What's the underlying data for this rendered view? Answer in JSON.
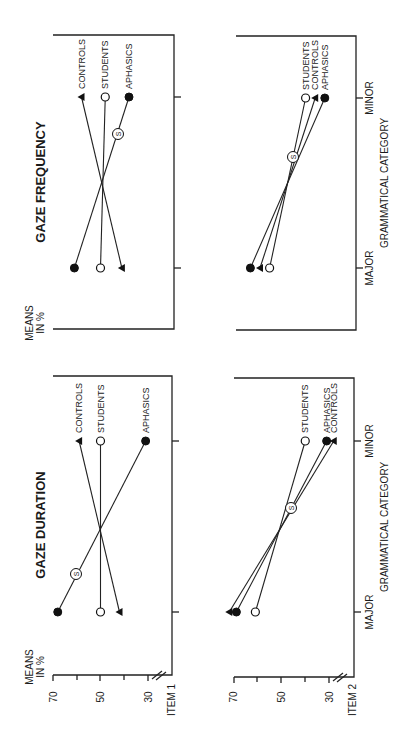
{
  "figure": {
    "orientation": "rotated-90-ccw",
    "y_axis_label": "MEANS IN %",
    "x_axis_label": "GRAMMATICAL CATEGORY",
    "x_categories": [
      "MAJOR",
      "MINOR"
    ],
    "y_ticks": [
      "70",
      "50",
      "30"
    ],
    "item_labels": [
      "ITEM 1",
      "ITEM 2"
    ],
    "panel_titles": [
      "GAZE DURATION",
      "GAZE FREQUENCY"
    ],
    "marker_note": "S"
  },
  "chart_data": [
    {
      "type": "line",
      "title": "GAZE DURATION",
      "subplot": "ITEM 1",
      "xlabel": "GRAMMATICAL CATEGORY",
      "ylabel": "MEANS IN %",
      "categories": [
        "MAJOR",
        "MINOR"
      ],
      "ylim": [
        30,
        70
      ],
      "yticks": [
        70,
        50,
        30
      ],
      "grid": false,
      "legend": "inline labels at MINOR end",
      "series": [
        {
          "name": "CONTROLS",
          "marker": "filled-triangle",
          "values": [
            42,
            59
          ]
        },
        {
          "name": "STUDENTS",
          "marker": "open-circle",
          "values": [
            50,
            50
          ]
        },
        {
          "name": "APHASICS",
          "marker": "filled-circle",
          "values": [
            68,
            31
          ],
          "annotation": "S"
        }
      ]
    },
    {
      "type": "line",
      "title": "GAZE DURATION",
      "subplot": "ITEM 2",
      "xlabel": "GRAMMATICAL CATEGORY",
      "ylabel": "MEANS IN %",
      "categories": [
        "MAJOR",
        "MINOR"
      ],
      "ylim": [
        30,
        70
      ],
      "yticks": [
        70,
        50,
        30
      ],
      "grid": false,
      "legend": "inline labels at MINOR end",
      "series": [
        {
          "name": "STUDENTS",
          "marker": "open-circle",
          "values": [
            61,
            40
          ]
        },
        {
          "name": "APHASICS",
          "marker": "filled-circle",
          "values": [
            69,
            31
          ]
        },
        {
          "name": "CONTROLS",
          "marker": "filled-triangle",
          "values": [
            72,
            28
          ]
        }
      ],
      "annotation": "S"
    },
    {
      "type": "line",
      "title": "GAZE FREQUENCY",
      "subplot": "ITEM 1",
      "xlabel": "",
      "ylabel": "MEANS IN %",
      "categories": [
        "MAJOR",
        "MINOR"
      ],
      "ylim": [
        30,
        70
      ],
      "grid": false,
      "legend": "inline labels at MINOR end",
      "series": [
        {
          "name": "CONTROLS",
          "marker": "filled-triangle",
          "values": [
            41,
            58
          ]
        },
        {
          "name": "STUDENTS",
          "marker": "open-circle",
          "values": [
            50,
            48
          ]
        },
        {
          "name": "APHASICS",
          "marker": "filled-circle",
          "values": [
            61,
            38
          ],
          "annotation": "S"
        }
      ]
    },
    {
      "type": "line",
      "title": "GAZE FREQUENCY",
      "subplot": "ITEM 2",
      "xlabel": "GRAMMATICAL CATEGORY",
      "ylabel": "",
      "categories": [
        "MAJOR",
        "MINOR"
      ],
      "ylim": [
        30,
        70
      ],
      "grid": false,
      "legend": "inline labels at MINOR end",
      "series": [
        {
          "name": "STUDENTS",
          "marker": "open-circle",
          "values": [
            56,
            41
          ]
        },
        {
          "name": "CONTROLS",
          "marker": "filled-triangle",
          "values": [
            60,
            37
          ]
        },
        {
          "name": "APHASICS",
          "marker": "filled-circle",
          "values": [
            64,
            33
          ]
        }
      ],
      "annotation": "S"
    }
  ]
}
